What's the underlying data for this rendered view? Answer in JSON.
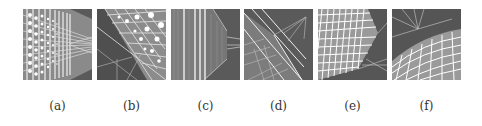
{
  "figure": {
    "panels": [
      {
        "id": "a",
        "label": "(a)",
        "description": "perspective grid of dots receding to the right"
      },
      {
        "id": "b",
        "label": "(b)",
        "description": "tilted grid with large dots, rays from lower-left"
      },
      {
        "id": "c",
        "label": "(c)",
        "description": "vertical striped textured plane with perspective wedge"
      },
      {
        "id": "d",
        "label": "(d)",
        "description": "diagonal textured plane with rays to upper-right"
      },
      {
        "id": "e",
        "label": "(e)",
        "description": "white lattice block in perspective, rays lower-right"
      },
      {
        "id": "f",
        "label": "(f)",
        "description": "curved lattice surface from below, rays at top"
      }
    ],
    "colors": {
      "panel_bg": "#555555",
      "lines": "#f0f0f0",
      "label": "#333333"
    }
  }
}
